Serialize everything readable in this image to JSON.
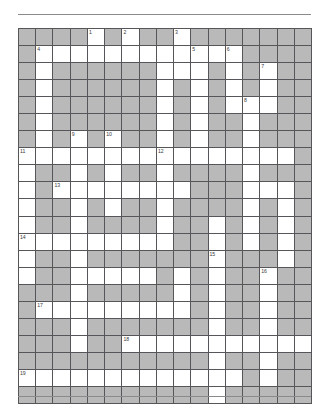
{
  "grid": {
    "columns": 17,
    "rows": 21,
    "colors": {
      "open_cell": "#ffffff",
      "block_cell": "#b9b9b9",
      "cell_border": "#55555a",
      "grid_border": "#4a4a4a",
      "rule": "#8a8a8a",
      "number_text": "#3a3a3a"
    },
    "legend": {
      "open": "white fillable letter cell",
      "block": "gray blocked cell"
    },
    "clue_numbers": [
      1,
      2,
      3,
      4,
      5,
      6,
      7,
      8,
      9,
      10,
      11,
      12,
      13,
      14,
      15,
      16,
      17,
      18,
      19
    ],
    "cells": [
      [
        {
          "t": "block"
        },
        {
          "t": "block"
        },
        {
          "t": "block"
        },
        {
          "t": "block"
        },
        {
          "t": "open",
          "n": "1"
        },
        {
          "t": "block"
        },
        {
          "t": "open",
          "n": "2"
        },
        {
          "t": "block"
        },
        {
          "t": "block"
        },
        {
          "t": "open",
          "n": "3"
        },
        {
          "t": "block"
        },
        {
          "t": "block"
        },
        {
          "t": "block"
        },
        {
          "t": "block"
        },
        {
          "t": "block"
        },
        {
          "t": "block"
        },
        {
          "t": "block"
        }
      ],
      [
        {
          "t": "block"
        },
        {
          "t": "open",
          "n": "4"
        },
        {
          "t": "open"
        },
        {
          "t": "open"
        },
        {
          "t": "open"
        },
        {
          "t": "open"
        },
        {
          "t": "open"
        },
        {
          "t": "open"
        },
        {
          "t": "open"
        },
        {
          "t": "open"
        },
        {
          "t": "open",
          "n": "5"
        },
        {
          "t": "open"
        },
        {
          "t": "open",
          "n": "6"
        },
        {
          "t": "block"
        },
        {
          "t": "block"
        },
        {
          "t": "block"
        },
        {
          "t": "block"
        }
      ],
      [
        {
          "t": "block"
        },
        {
          "t": "open"
        },
        {
          "t": "block"
        },
        {
          "t": "block"
        },
        {
          "t": "block"
        },
        {
          "t": "block"
        },
        {
          "t": "block"
        },
        {
          "t": "block"
        },
        {
          "t": "open"
        },
        {
          "t": "open"
        },
        {
          "t": "open"
        },
        {
          "t": "block"
        },
        {
          "t": "open"
        },
        {
          "t": "block"
        },
        {
          "t": "open",
          "n": "7"
        },
        {
          "t": "block"
        },
        {
          "t": "block"
        }
      ],
      [
        {
          "t": "block"
        },
        {
          "t": "open"
        },
        {
          "t": "block"
        },
        {
          "t": "block"
        },
        {
          "t": "block"
        },
        {
          "t": "block"
        },
        {
          "t": "block"
        },
        {
          "t": "block"
        },
        {
          "t": "open"
        },
        {
          "t": "block"
        },
        {
          "t": "open"
        },
        {
          "t": "block"
        },
        {
          "t": "open"
        },
        {
          "t": "block"
        },
        {
          "t": "open"
        },
        {
          "t": "block"
        },
        {
          "t": "block"
        }
      ],
      [
        {
          "t": "block"
        },
        {
          "t": "open"
        },
        {
          "t": "block"
        },
        {
          "t": "block"
        },
        {
          "t": "block"
        },
        {
          "t": "block"
        },
        {
          "t": "block"
        },
        {
          "t": "block"
        },
        {
          "t": "open"
        },
        {
          "t": "block"
        },
        {
          "t": "open"
        },
        {
          "t": "block"
        },
        {
          "t": "open"
        },
        {
          "t": "open",
          "n": "8"
        },
        {
          "t": "open"
        },
        {
          "t": "block"
        },
        {
          "t": "block"
        }
      ],
      [
        {
          "t": "block"
        },
        {
          "t": "open"
        },
        {
          "t": "block"
        },
        {
          "t": "block"
        },
        {
          "t": "block"
        },
        {
          "t": "block"
        },
        {
          "t": "block"
        },
        {
          "t": "block"
        },
        {
          "t": "open"
        },
        {
          "t": "block"
        },
        {
          "t": "open"
        },
        {
          "t": "block"
        },
        {
          "t": "block"
        },
        {
          "t": "open"
        },
        {
          "t": "block"
        },
        {
          "t": "block"
        },
        {
          "t": "block"
        }
      ],
      [
        {
          "t": "block"
        },
        {
          "t": "open"
        },
        {
          "t": "block"
        },
        {
          "t": "open",
          "n": "9"
        },
        {
          "t": "block"
        },
        {
          "t": "open",
          "n": "10"
        },
        {
          "t": "block"
        },
        {
          "t": "block"
        },
        {
          "t": "open"
        },
        {
          "t": "block"
        },
        {
          "t": "open"
        },
        {
          "t": "block"
        },
        {
          "t": "block"
        },
        {
          "t": "open"
        },
        {
          "t": "block"
        },
        {
          "t": "block"
        },
        {
          "t": "block"
        }
      ],
      [
        {
          "t": "open",
          "n": "11"
        },
        {
          "t": "open"
        },
        {
          "t": "open"
        },
        {
          "t": "open"
        },
        {
          "t": "open"
        },
        {
          "t": "open"
        },
        {
          "t": "open"
        },
        {
          "t": "open"
        },
        {
          "t": "open",
          "n": "12"
        },
        {
          "t": "open"
        },
        {
          "t": "open"
        },
        {
          "t": "open"
        },
        {
          "t": "open"
        },
        {
          "t": "open"
        },
        {
          "t": "open"
        },
        {
          "t": "open"
        },
        {
          "t": "block"
        }
      ],
      [
        {
          "t": "open"
        },
        {
          "t": "block"
        },
        {
          "t": "block"
        },
        {
          "t": "open"
        },
        {
          "t": "block"
        },
        {
          "t": "open"
        },
        {
          "t": "block"
        },
        {
          "t": "block"
        },
        {
          "t": "open"
        },
        {
          "t": "block"
        },
        {
          "t": "block"
        },
        {
          "t": "block"
        },
        {
          "t": "block"
        },
        {
          "t": "open"
        },
        {
          "t": "block"
        },
        {
          "t": "block"
        },
        {
          "t": "block"
        }
      ],
      [
        {
          "t": "open"
        },
        {
          "t": "block"
        },
        {
          "t": "open",
          "n": "13"
        },
        {
          "t": "open"
        },
        {
          "t": "open"
        },
        {
          "t": "open"
        },
        {
          "t": "open"
        },
        {
          "t": "open"
        },
        {
          "t": "open"
        },
        {
          "t": "open"
        },
        {
          "t": "block"
        },
        {
          "t": "block"
        },
        {
          "t": "block"
        },
        {
          "t": "open"
        },
        {
          "t": "open"
        },
        {
          "t": "open"
        },
        {
          "t": "block"
        }
      ],
      [
        {
          "t": "open"
        },
        {
          "t": "block"
        },
        {
          "t": "block"
        },
        {
          "t": "open"
        },
        {
          "t": "block"
        },
        {
          "t": "open"
        },
        {
          "t": "block"
        },
        {
          "t": "block"
        },
        {
          "t": "open"
        },
        {
          "t": "block"
        },
        {
          "t": "block"
        },
        {
          "t": "block"
        },
        {
          "t": "block"
        },
        {
          "t": "open"
        },
        {
          "t": "block"
        },
        {
          "t": "open"
        },
        {
          "t": "block"
        }
      ],
      [
        {
          "t": "open"
        },
        {
          "t": "block"
        },
        {
          "t": "block"
        },
        {
          "t": "open"
        },
        {
          "t": "block"
        },
        {
          "t": "block"
        },
        {
          "t": "block"
        },
        {
          "t": "block"
        },
        {
          "t": "open"
        },
        {
          "t": "block"
        },
        {
          "t": "block"
        },
        {
          "t": "open"
        },
        {
          "t": "block"
        },
        {
          "t": "open"
        },
        {
          "t": "block"
        },
        {
          "t": "open"
        },
        {
          "t": "block"
        }
      ],
      [
        {
          "t": "open",
          "n": "14"
        },
        {
          "t": "open"
        },
        {
          "t": "open"
        },
        {
          "t": "open"
        },
        {
          "t": "open"
        },
        {
          "t": "open"
        },
        {
          "t": "open"
        },
        {
          "t": "open"
        },
        {
          "t": "open"
        },
        {
          "t": "block"
        },
        {
          "t": "block"
        },
        {
          "t": "open"
        },
        {
          "t": "block"
        },
        {
          "t": "open"
        },
        {
          "t": "block"
        },
        {
          "t": "open"
        },
        {
          "t": "block"
        }
      ],
      [
        {
          "t": "open"
        },
        {
          "t": "block"
        },
        {
          "t": "block"
        },
        {
          "t": "open"
        },
        {
          "t": "block"
        },
        {
          "t": "block"
        },
        {
          "t": "block"
        },
        {
          "t": "block"
        },
        {
          "t": "block"
        },
        {
          "t": "block"
        },
        {
          "t": "block"
        },
        {
          "t": "open",
          "n": "15"
        },
        {
          "t": "block"
        },
        {
          "t": "block"
        },
        {
          "t": "block"
        },
        {
          "t": "open"
        },
        {
          "t": "block"
        }
      ],
      [
        {
          "t": "open"
        },
        {
          "t": "block"
        },
        {
          "t": "block"
        },
        {
          "t": "open"
        },
        {
          "t": "open"
        },
        {
          "t": "open"
        },
        {
          "t": "open"
        },
        {
          "t": "open"
        },
        {
          "t": "block"
        },
        {
          "t": "open"
        },
        {
          "t": "block"
        },
        {
          "t": "open"
        },
        {
          "t": "block"
        },
        {
          "t": "block"
        },
        {
          "t": "open",
          "n": "16"
        },
        {
          "t": "block"
        },
        {
          "t": "block"
        }
      ],
      [
        {
          "t": "block"
        },
        {
          "t": "block"
        },
        {
          "t": "block"
        },
        {
          "t": "open"
        },
        {
          "t": "block"
        },
        {
          "t": "block"
        },
        {
          "t": "block"
        },
        {
          "t": "block"
        },
        {
          "t": "block"
        },
        {
          "t": "open"
        },
        {
          "t": "block"
        },
        {
          "t": "open"
        },
        {
          "t": "block"
        },
        {
          "t": "block"
        },
        {
          "t": "open"
        },
        {
          "t": "block"
        },
        {
          "t": "block"
        }
      ],
      [
        {
          "t": "block"
        },
        {
          "t": "open",
          "n": "17"
        },
        {
          "t": "open"
        },
        {
          "t": "open"
        },
        {
          "t": "open"
        },
        {
          "t": "open"
        },
        {
          "t": "open"
        },
        {
          "t": "open"
        },
        {
          "t": "open"
        },
        {
          "t": "open"
        },
        {
          "t": "block"
        },
        {
          "t": "open"
        },
        {
          "t": "block"
        },
        {
          "t": "block"
        },
        {
          "t": "open"
        },
        {
          "t": "block"
        },
        {
          "t": "block"
        }
      ],
      [
        {
          "t": "block"
        },
        {
          "t": "block"
        },
        {
          "t": "block"
        },
        {
          "t": "open"
        },
        {
          "t": "block"
        },
        {
          "t": "block"
        },
        {
          "t": "block"
        },
        {
          "t": "block"
        },
        {
          "t": "block"
        },
        {
          "t": "block"
        },
        {
          "t": "block"
        },
        {
          "t": "open"
        },
        {
          "t": "block"
        },
        {
          "t": "block"
        },
        {
          "t": "open"
        },
        {
          "t": "block"
        },
        {
          "t": "block"
        }
      ],
      [
        {
          "t": "block"
        },
        {
          "t": "block"
        },
        {
          "t": "block"
        },
        {
          "t": "open"
        },
        {
          "t": "block"
        },
        {
          "t": "block"
        },
        {
          "t": "open",
          "n": "18"
        },
        {
          "t": "open"
        },
        {
          "t": "open"
        },
        {
          "t": "open"
        },
        {
          "t": "open"
        },
        {
          "t": "open"
        },
        {
          "t": "open"
        },
        {
          "t": "open"
        },
        {
          "t": "open"
        },
        {
          "t": "open"
        },
        {
          "t": "open"
        }
      ],
      [
        {
          "t": "block"
        },
        {
          "t": "block"
        },
        {
          "t": "block"
        },
        {
          "t": "block"
        },
        {
          "t": "block"
        },
        {
          "t": "block"
        },
        {
          "t": "block"
        },
        {
          "t": "block"
        },
        {
          "t": "block"
        },
        {
          "t": "block"
        },
        {
          "t": "block"
        },
        {
          "t": "open"
        },
        {
          "t": "block"
        },
        {
          "t": "block"
        },
        {
          "t": "open"
        },
        {
          "t": "block"
        },
        {
          "t": "block"
        }
      ],
      [
        {
          "t": "open",
          "n": "19"
        },
        {
          "t": "open"
        },
        {
          "t": "open"
        },
        {
          "t": "open"
        },
        {
          "t": "open"
        },
        {
          "t": "open"
        },
        {
          "t": "open"
        },
        {
          "t": "open"
        },
        {
          "t": "open"
        },
        {
          "t": "open"
        },
        {
          "t": "open"
        },
        {
          "t": "open"
        },
        {
          "t": "open"
        },
        {
          "t": "block"
        },
        {
          "t": "open"
        },
        {
          "t": "block"
        },
        {
          "t": "block"
        }
      ],
      [
        {
          "t": "block"
        },
        {
          "t": "block"
        },
        {
          "t": "block"
        },
        {
          "t": "block"
        },
        {
          "t": "block"
        },
        {
          "t": "block"
        },
        {
          "t": "block"
        },
        {
          "t": "block"
        },
        {
          "t": "block"
        },
        {
          "t": "block"
        },
        {
          "t": "block"
        },
        {
          "t": "open"
        },
        {
          "t": "block"
        },
        {
          "t": "block"
        },
        {
          "t": "block"
        },
        {
          "t": "block"
        },
        {
          "t": "block"
        }
      ]
    ]
  }
}
